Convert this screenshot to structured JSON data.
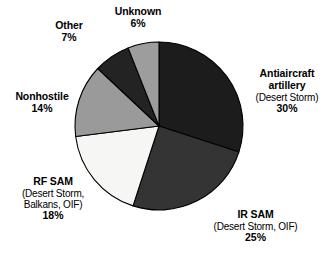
{
  "chart_data": {
    "type": "pie",
    "title": "",
    "subtitle": "",
    "xlabel": "",
    "ylabel": "",
    "legend_position": "none",
    "grid": false,
    "units": "percent",
    "start_angle_deg": 0,
    "direction": "clockwise",
    "center": {
      "x": 159,
      "y": 126,
      "radius": 84
    },
    "categories": [
      "Antiaircraft artillery",
      "IR SAM",
      "RF SAM",
      "Nonhostile",
      "Other",
      "Unknown"
    ],
    "values": [
      30,
      25,
      18,
      14,
      7,
      6
    ],
    "colors": [
      "#1c1c1c",
      "#343434",
      "#f6f6f4",
      "#9a9a9a",
      "#232323",
      "#9d9d9d"
    ],
    "slices": [
      {
        "name": "Antiaircraft artillery",
        "value": 30,
        "color": "#1c1c1c",
        "annotation": "(Desert Storm)"
      },
      {
        "name": "IR SAM",
        "value": 25,
        "color": "#343434",
        "annotation": "(Desert Storm, OIF)"
      },
      {
        "name": "RF SAM",
        "value": 18,
        "color": "#f6f6f4",
        "annotation": "(Desert Storm, Balkans, OIF)"
      },
      {
        "name": "Nonhostile",
        "value": 14,
        "color": "#9a9a9a",
        "annotation": ""
      },
      {
        "name": "Other",
        "value": 7,
        "color": "#232323",
        "annotation": ""
      },
      {
        "name": "Unknown",
        "value": 6,
        "color": "#9d9d9d",
        "annotation": ""
      }
    ]
  },
  "labels": {
    "antiaircraft": {
      "line1": "Antiaircraft",
      "line2": "artillery",
      "line3": "(Desert Storm)",
      "pct": "30%"
    },
    "irsam": {
      "line1": "IR SAM",
      "line2": "(Desert Storm, OIF)",
      "pct": "25%"
    },
    "rfsam": {
      "line1": "RF SAM",
      "line2": "(Desert Storm,",
      "line3": "Balkans, OIF)",
      "pct": "18%"
    },
    "nonhostile": {
      "line1": "Nonhostile",
      "pct": "14%"
    },
    "other": {
      "line1": "Other",
      "pct": "7%"
    },
    "unknown": {
      "line1": "Unknown",
      "pct": "6%"
    }
  },
  "style": {
    "background": "#ffffff",
    "stroke": "#000000",
    "text": "#000000"
  }
}
